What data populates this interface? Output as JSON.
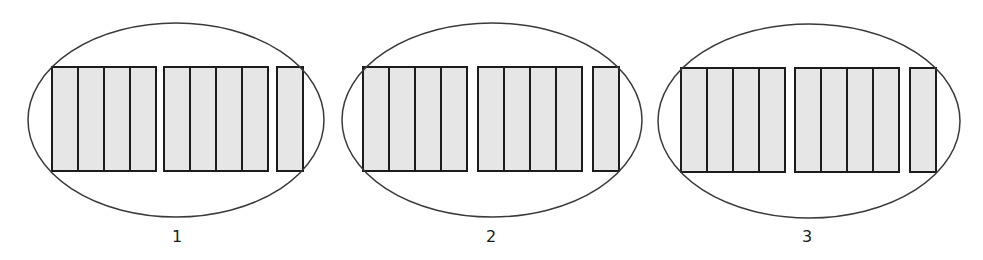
{
  "diagram": {
    "colors": {
      "bar_fill": "#e6e6e6",
      "bar_stroke": "#1c1c1c",
      "ellipse_stroke": "#3a3a3a"
    },
    "groups": [
      {
        "label": "1",
        "ellipse": {
          "cx": 176,
          "cy": 120,
          "rx": 148,
          "ry": 97
        },
        "bar_top": 67,
        "bar_height": 104,
        "clusters": [
          {
            "x": 52,
            "count": 4,
            "bar_width": 26
          },
          {
            "x": 164,
            "count": 4,
            "bar_width": 26
          },
          {
            "x": 277,
            "count": 1,
            "bar_width": 26
          }
        ],
        "label_x": 177,
        "label_y": 229
      },
      {
        "label": "2",
        "ellipse": {
          "cx": 492,
          "cy": 120,
          "rx": 150,
          "ry": 97
        },
        "bar_top": 67,
        "bar_height": 104,
        "clusters": [
          {
            "x": 363,
            "count": 4,
            "bar_width": 26
          },
          {
            "x": 478,
            "count": 4,
            "bar_width": 26
          },
          {
            "x": 593,
            "count": 1,
            "bar_width": 26
          }
        ],
        "label_x": 491,
        "label_y": 229
      },
      {
        "label": "3",
        "ellipse": {
          "cx": 809,
          "cy": 121,
          "rx": 151,
          "ry": 97
        },
        "bar_top": 68,
        "bar_height": 104,
        "clusters": [
          {
            "x": 681,
            "count": 4,
            "bar_width": 26
          },
          {
            "x": 795,
            "count": 4,
            "bar_width": 26
          },
          {
            "x": 910,
            "count": 1,
            "bar_width": 26
          }
        ],
        "label_x": 807,
        "label_y": 229
      }
    ]
  }
}
